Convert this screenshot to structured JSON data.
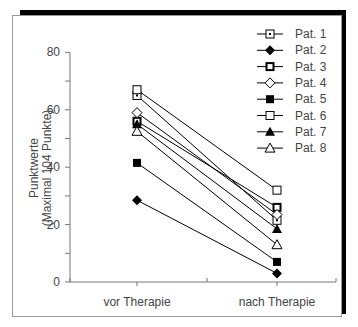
{
  "chart_data": {
    "type": "line",
    "title": "",
    "xlabel": "",
    "ylabel": "Punktwerte (Maximal 104 Punkte)",
    "ylabel_lines": [
      "Punktwerte",
      "(Maximal 104 Punkte)"
    ],
    "categories": [
      "vor Therapie",
      "nach Therapie"
    ],
    "ylim": [
      0,
      80
    ],
    "yticks": [
      0,
      20,
      40,
      60,
      80
    ],
    "ytick_labels": [
      "0",
      "20",
      "40",
      "60",
      "80"
    ],
    "grid": false,
    "legend_position": "upper right",
    "series": [
      {
        "name": "Pat. 1",
        "marker": "square-dot",
        "values": [
          65,
          21.5
        ]
      },
      {
        "name": "Pat. 2",
        "marker": "diamond-filled",
        "values": [
          28.5,
          3
        ]
      },
      {
        "name": "Pat. 3",
        "marker": "square-thick",
        "values": [
          56,
          26
        ]
      },
      {
        "name": "Pat. 4",
        "marker": "diamond-open",
        "values": [
          59,
          23.5
        ]
      },
      {
        "name": "Pat. 5",
        "marker": "square-filled",
        "values": [
          41.5,
          7
        ]
      },
      {
        "name": "Pat. 6",
        "marker": "square-open",
        "values": [
          67,
          32
        ]
      },
      {
        "name": "Pat. 7",
        "marker": "triangle-filled",
        "values": [
          55,
          18.5
        ]
      },
      {
        "name": "Pat. 8",
        "marker": "triangle-open",
        "values": [
          52.5,
          13
        ]
      }
    ]
  }
}
